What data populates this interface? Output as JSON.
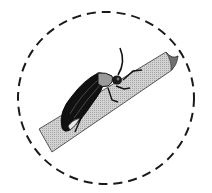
{
  "illustration": {
    "subject": "firefly beetle on grass blade",
    "frame": "dashed-circle",
    "colors": {
      "background": "#ffffff",
      "outline": "#1a1a1a",
      "leaf_fill": "#c8c8c8",
      "leaf_dark": "#8a8a8a",
      "body": "#111111",
      "pronotum": "#9a9a9a",
      "abdomen_light": "#e6e6e6"
    }
  }
}
